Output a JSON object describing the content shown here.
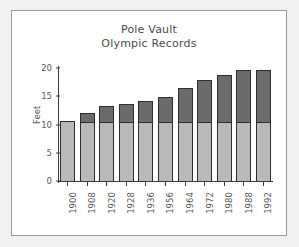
{
  "chart_data": {
    "type": "bar",
    "title": "Pole Vault Olympic Records",
    "title_lines": [
      "Pole Vault",
      "Olympic Records"
    ],
    "xlabel": "",
    "ylabel": "Feet",
    "ylim": [
      0,
      20
    ],
    "yticks": [
      0,
      5,
      10,
      15,
      20
    ],
    "ytick_labels": [
      "0",
      "5",
      "10",
      "15",
      "20"
    ],
    "grid": false,
    "legend": "none",
    "stacked": true,
    "categories": [
      "1900",
      "1908",
      "1920",
      "1928",
      "1936",
      "1956",
      "1964",
      "1972",
      "1980",
      "1988",
      "1992"
    ],
    "values": [
      10.7,
      12.1,
      13.2,
      13.6,
      14.2,
      14.8,
      16.5,
      17.9,
      18.7,
      19.6,
      19.6
    ],
    "series": [
      {
        "name": "base",
        "color": "#b9b9b9",
        "values": [
          10.7,
          10.6,
          10.6,
          10.6,
          10.6,
          10.6,
          10.6,
          10.6,
          10.6,
          10.6,
          10.6
        ]
      },
      {
        "name": "gain",
        "color": "#6b6b6b",
        "values": [
          0.0,
          1.5,
          2.6,
          3.0,
          3.6,
          4.2,
          5.9,
          7.3,
          8.1,
          9.0,
          9.0
        ]
      }
    ],
    "colors": {
      "base": "#b9b9b9",
      "gain": "#6b6b6b",
      "axis": "#3b3b3b",
      "text": "#5a5a5a",
      "frame": "#9a9a9a",
      "background": "#f1f1f1",
      "plot_background": "#ffffff"
    }
  }
}
